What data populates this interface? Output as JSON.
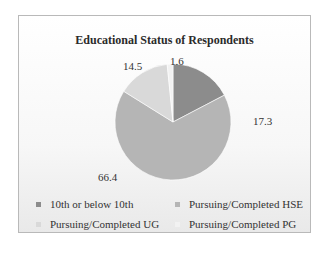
{
  "chart_data": {
    "type": "pie",
    "title": "Educational Status of Respondents",
    "categories": [
      "10th or below 10th",
      "Pursuing/Completed HSE",
      "Pursuing/Completed UG",
      "Pursuing/Completed PG"
    ],
    "values": [
      17.3,
      66.4,
      14.5,
      1.6
    ],
    "colors": [
      "#8c8c8c",
      "#b5b5b5",
      "#d9d9d9",
      "#f2f2f2"
    ],
    "data_labels": [
      "17.3",
      "66.4",
      "14.5",
      "1.6"
    ],
    "legend_position": "bottom",
    "start_angle": "12 o'clock, clockwise"
  },
  "labels": {
    "v0": "17.3",
    "v1": "66.4",
    "v2": "14.5",
    "v3": "1.6"
  },
  "legend": [
    {
      "label": "10th or below 10th",
      "color": "#8c8c8c"
    },
    {
      "label": "Pursuing/Completed HSE",
      "color": "#b5b5b5"
    },
    {
      "label": "Pursuing/Completed UG",
      "color": "#d9d9d9"
    },
    {
      "label": "Pursuing/Completed PG",
      "color": "#f2f2f2"
    }
  ]
}
